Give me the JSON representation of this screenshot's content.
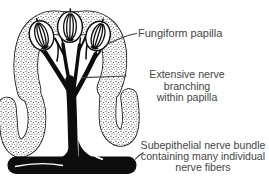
{
  "colors": {
    "background": "#ffffff",
    "ink": "#0d0d0d",
    "text": "#454545",
    "leader": "#3c3c3c"
  },
  "diagram": {
    "title_none": "",
    "labels": {
      "fungiform_papilla": "Fungiform papilla",
      "nerve_branching": {
        "line1": "Extensive nerve branching",
        "line2": "within papilla"
      },
      "nerve_bundle": {
        "line1": "Subepithelial nerve bundle",
        "line2": "containing many individual",
        "line3": "nerve fibers"
      }
    }
  }
}
